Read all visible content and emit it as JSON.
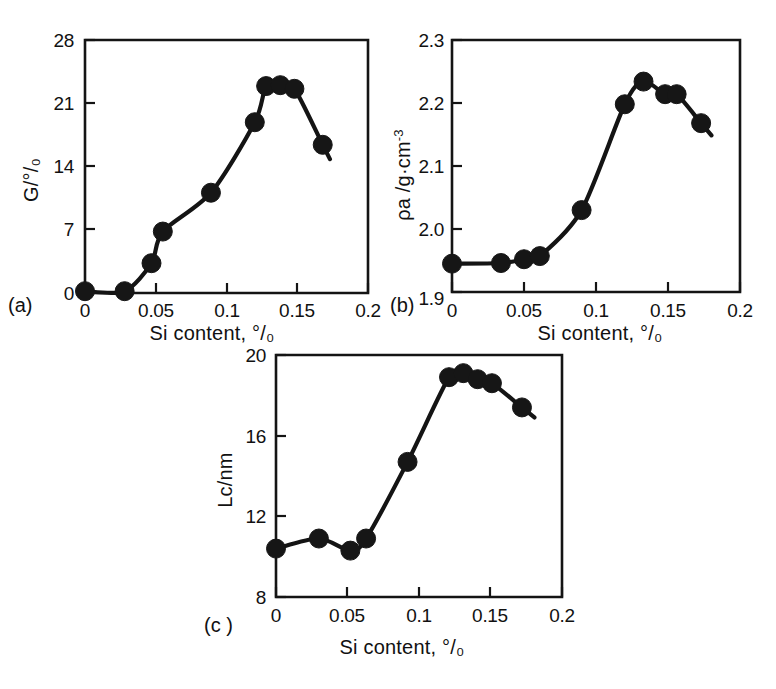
{
  "figure": {
    "panels": [
      {
        "id": "a",
        "label": "(a)",
        "ylabel": "G/°/₀",
        "ylabel_plain": "G/%",
        "xlabel": "Si content, °/₀",
        "xlabel_plain": "Si content, %",
        "xticks": [
          "0",
          "0.05",
          "0.1",
          "0.15",
          "0.2"
        ],
        "yticks": [
          "0",
          "7",
          "14",
          "21",
          "28"
        ]
      },
      {
        "id": "b",
        "label": "(b)",
        "ylabel": "ρa /g·cm",
        "ylabel_exp": "-3",
        "ylabel_plain": "ρa /g·cm-3",
        "xlabel": "Si content, °/₀",
        "xlabel_plain": "Si content, %",
        "xticks": [
          "0",
          "0.05",
          "0.1",
          "0.15",
          "0.2"
        ],
        "yticks": [
          "1.9",
          "2.0",
          "2.1",
          "2.2",
          "2.3"
        ]
      },
      {
        "id": "c",
        "label": "(c )",
        "ylabel": "Lc/nm",
        "ylabel_plain": "Lc/nm",
        "xlabel": "Si content, °/₀",
        "xlabel_plain": "Si content, %",
        "xticks": [
          "0",
          "0.05",
          "0.1",
          "0.15",
          "0.2"
        ],
        "yticks": [
          "8",
          "12",
          "16",
          "20"
        ]
      }
    ]
  },
  "chart_data": [
    {
      "type": "scatter",
      "panel": "a",
      "title": "",
      "xlabel": "Si content, %",
      "ylabel": "G/%",
      "xlim": [
        0,
        0.2
      ],
      "ylim": [
        0,
        28
      ],
      "xticks": [
        0,
        0.05,
        0.1,
        0.15,
        0.2
      ],
      "yticks": [
        0,
        7,
        14,
        21,
        28
      ],
      "grid": false,
      "legend": "none",
      "marker": "filled-circle",
      "connected": true,
      "x": [
        0.0,
        0.028,
        0.047,
        0.055,
        0.089,
        0.12,
        0.128,
        0.138,
        0.148,
        0.168
      ],
      "y": [
        0.2,
        0.2,
        3.3,
        6.8,
        11.1,
        18.9,
        22.9,
        23.0,
        22.6,
        16.4
      ]
    },
    {
      "type": "scatter",
      "panel": "b",
      "title": "",
      "xlabel": "Si content, %",
      "ylabel": "ρa /g·cm-3",
      "xlim": [
        0,
        0.2
      ],
      "ylim": [
        1.9,
        2.3
      ],
      "xticks": [
        0,
        0.05,
        0.1,
        0.15,
        0.2
      ],
      "yticks": [
        1.9,
        2.0,
        2.1,
        2.2,
        2.3
      ],
      "grid": false,
      "legend": "none",
      "marker": "filled-circle",
      "connected": true,
      "x": [
        0.0,
        0.034,
        0.05,
        0.061,
        0.09,
        0.12,
        0.133,
        0.148,
        0.156,
        0.173
      ],
      "y": [
        1.945,
        1.946,
        1.952,
        1.957,
        2.03,
        2.198,
        2.234,
        2.214,
        2.214,
        2.168
      ]
    },
    {
      "type": "scatter",
      "panel": "c",
      "title": "",
      "xlabel": "Si content, %",
      "ylabel": "Lc/nm",
      "xlim": [
        0,
        0.2
      ],
      "ylim": [
        8,
        20
      ],
      "xticks": [
        0,
        0.05,
        0.1,
        0.15,
        0.2
      ],
      "yticks": [
        8,
        12,
        16,
        20
      ],
      "grid": false,
      "legend": "none",
      "marker": "filled-circle",
      "connected": true,
      "x": [
        0.0,
        0.03,
        0.052,
        0.063,
        0.092,
        0.121,
        0.131,
        0.141,
        0.151,
        0.172
      ],
      "y": [
        10.4,
        10.9,
        10.3,
        10.9,
        14.7,
        18.9,
        19.1,
        18.8,
        18.6,
        17.4
      ]
    }
  ]
}
